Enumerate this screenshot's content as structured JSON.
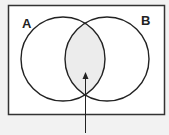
{
  "diagram": {
    "type": "venn",
    "sets": [
      {
        "label": "A",
        "cx": 63,
        "cy": 59,
        "r": 42
      },
      {
        "label": "B",
        "cx": 107,
        "cy": 59,
        "r": 42
      }
    ],
    "intersection_shaded": true,
    "colors": {
      "background": "#f2f2f2",
      "universe_fill": "#ffffff",
      "intersection_fill": "#ececec",
      "stroke": "#222222"
    },
    "pointer_arrow": {
      "from": [
        85,
        133
      ],
      "to": [
        85,
        74
      ]
    }
  }
}
